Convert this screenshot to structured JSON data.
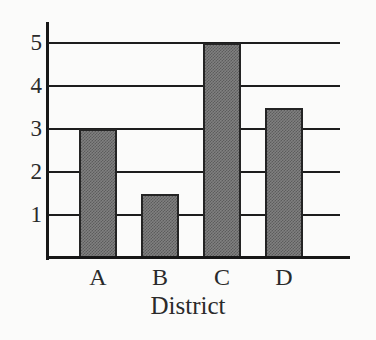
{
  "chart_data": {
    "type": "bar",
    "title": "",
    "subtitle": "",
    "xlabel": "District",
    "ylabel": "",
    "categories": [
      "A",
      "B",
      "C",
      "D"
    ],
    "values": [
      3,
      1.5,
      5,
      3.5
    ],
    "series": [
      {
        "name": "",
        "values": [
          3,
          1.5,
          5,
          3.5
        ]
      }
    ],
    "ylim": [
      0,
      5.5
    ],
    "yticks": [
      1,
      2,
      3,
      4,
      5
    ],
    "ytick_labels": [
      "1",
      "2",
      "3",
      "4",
      "5"
    ],
    "xtick_labels": [
      "A",
      "B",
      "C",
      "D"
    ],
    "grid": true,
    "grid_axis": "y",
    "legend": false,
    "legend_position": "none",
    "annotations": [],
    "colors": {
      "bar_fill": "#808080",
      "bar_edge": "#242424",
      "axis": "#171717",
      "gridline": "#1d1d1d",
      "text": "#2a2a2a",
      "background": "#fbfbfa"
    }
  },
  "axes": {
    "x_title": "District",
    "y_title": ""
  }
}
